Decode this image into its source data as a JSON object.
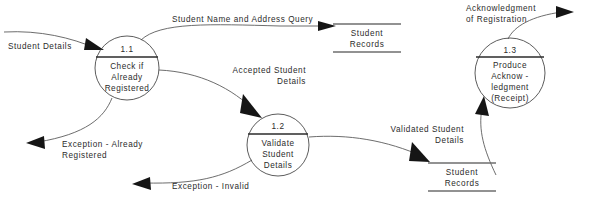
{
  "diagram": {
    "type": "data-flow-diagram",
    "background_color": "#ffffff",
    "line_color": "#5c5c5c",
    "text_color": "#2b2b2b",
    "processes": [
      {
        "id": "1.1",
        "number": "1.1",
        "lines": [
          "Check if",
          "Already",
          "Registered"
        ],
        "cx": 127,
        "cy": 68,
        "r": 32
      },
      {
        "id": "1.2",
        "number": "1.2",
        "lines": [
          "Validate",
          "Student",
          "Details"
        ],
        "cx": 278,
        "cy": 145,
        "r": 31
      },
      {
        "id": "1.3",
        "number": "1.3",
        "lines": [
          "Produce",
          "Acknow -",
          "ledgment",
          "(Receipt)"
        ],
        "cx": 510,
        "cy": 73,
        "r": 35
      }
    ],
    "data_stores": [
      {
        "id": "store-top",
        "lines": [
          "Student",
          "Records"
        ],
        "x": 333,
        "y": 23,
        "width": 68
      },
      {
        "id": "store-bottom",
        "lines": [
          "Student",
          "Records"
        ],
        "x": 428,
        "y": 162,
        "width": 68
      }
    ],
    "flows": [
      {
        "id": "student-details",
        "label": "Student Details",
        "x": 8,
        "y": 41,
        "align": "left"
      },
      {
        "id": "student-name-query",
        "label": "Student Name and Address Query",
        "x": 172,
        "y": 14,
        "align": "left"
      },
      {
        "id": "accepted-student-details",
        "label": "Accepted Student\nDetails",
        "x": 196,
        "y": 65,
        "align": "right"
      },
      {
        "id": "exception-already",
        "label": "Exception - Already\nRegistered",
        "x": 62,
        "y": 139,
        "align": "left"
      },
      {
        "id": "exception-invalid",
        "label": "Exception - Invalid",
        "x": 172,
        "y": 181,
        "align": "left"
      },
      {
        "id": "validated-student",
        "label": "Validated Student\nDetails",
        "x": 372,
        "y": 124,
        "align": "right"
      },
      {
        "id": "acknowledgment",
        "label": "Acknowledgment\nof Registration",
        "x": 466,
        "y": 3,
        "align": "left"
      }
    ]
  }
}
